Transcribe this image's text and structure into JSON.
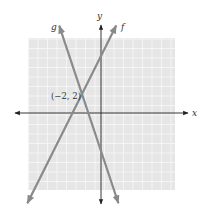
{
  "chart_data": {
    "type": "line",
    "title": "",
    "xlabel": "x",
    "ylabel": "y",
    "xlim": [
      -7.5,
      8
    ],
    "ylim": [
      -8,
      8
    ],
    "grid": true,
    "series": [
      {
        "name": "f",
        "equation": "y = 2x + 6",
        "slope": 2,
        "intercept": 6,
        "color": "#8a8a8a"
      },
      {
        "name": "g",
        "equation": "y = -3x - 4",
        "slope": -3,
        "intercept": -4,
        "color": "#8a8a8a"
      }
    ],
    "annotations": [
      {
        "text": "(−2, 2)",
        "x": -2,
        "y": 2
      }
    ]
  },
  "labels": {
    "x_axis": "x",
    "y_axis": "y",
    "line_f": "f",
    "line_g": "g",
    "point": "(−2, 2)"
  },
  "colors": {
    "grid_bg": "#e6e6e6",
    "grid_line": "#f7f7f7",
    "axis": "#222222",
    "line": "#8a8a8a"
  }
}
